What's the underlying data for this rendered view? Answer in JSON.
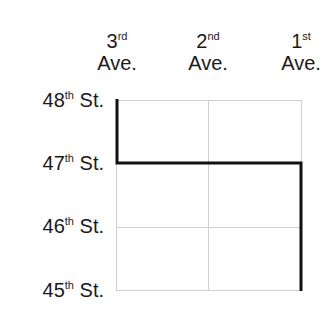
{
  "avenues": [
    {
      "num": "3",
      "suffix": "rd",
      "label": "Ave."
    },
    {
      "num": "2",
      "suffix": "nd",
      "label": "Ave."
    },
    {
      "num": "1",
      "suffix": "st",
      "label": "Ave."
    }
  ],
  "streets": [
    {
      "num": "48",
      "suffix": "th",
      "label": "St."
    },
    {
      "num": "47",
      "suffix": "th",
      "label": "St."
    },
    {
      "num": "46",
      "suffix": "th",
      "label": "St."
    },
    {
      "num": "45",
      "suffix": "th",
      "label": "St."
    }
  ],
  "colors": {
    "grid": "#cfcfcf",
    "path": "#111111"
  },
  "path_description": "Route from 3rd Ave & 48th St south to 47th St, east to 1st Ave, south to 45th St"
}
